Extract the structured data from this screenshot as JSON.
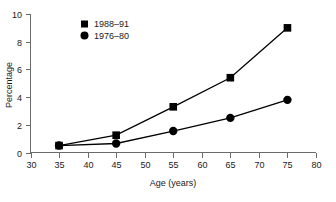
{
  "chart_data": {
    "type": "line",
    "title": "",
    "xlabel": "Age (years)",
    "ylabel": "Percentage",
    "xlim": [
      30,
      80
    ],
    "ylim": [
      0,
      10
    ],
    "xticks": [
      30,
      35,
      40,
      45,
      50,
      55,
      60,
      65,
      70,
      75,
      80
    ],
    "yticks": [
      0,
      2,
      4,
      6,
      8,
      10
    ],
    "xtick_labels": [
      "30",
      "35",
      "40",
      "45",
      "50",
      "55",
      "60",
      "65",
      "70",
      "75",
      "80"
    ],
    "ytick_labels": [
      "0",
      "2",
      "4",
      "6",
      "8",
      "10"
    ],
    "grid": false,
    "legend_position": "upper-left-inside",
    "x": [
      35,
      45,
      55,
      65,
      75
    ],
    "series": [
      {
        "name": "1988–91",
        "marker": "square",
        "color": "#000000",
        "values": [
          0.5,
          1.25,
          3.3,
          5.4,
          9.0
        ]
      },
      {
        "name": "1976–80",
        "marker": "circle",
        "color": "#000000",
        "values": [
          0.5,
          0.65,
          1.55,
          2.5,
          3.8
        ]
      }
    ]
  },
  "legend": {
    "entries": [
      {
        "label": "1988–91",
        "marker": "square"
      },
      {
        "label": "1976–80",
        "marker": "circle"
      }
    ]
  },
  "axes": {
    "x_title": "Age (years)",
    "y_title": "Percentage"
  }
}
